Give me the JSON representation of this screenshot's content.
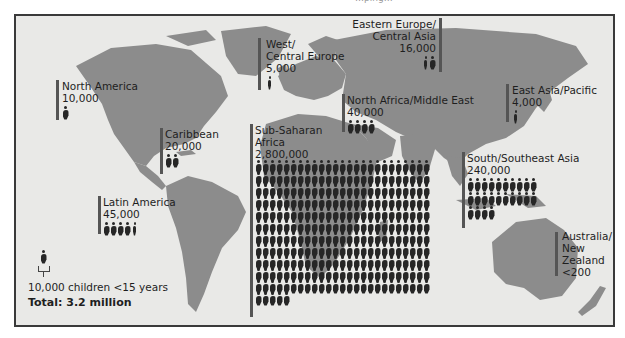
{
  "title_clip": "…ping…",
  "legend": {
    "unit_label": "10,000 children <15 years",
    "total_label": "Total: 3.2 million"
  },
  "regions": [
    {
      "id": "north-america",
      "name": "North America",
      "value": "10,000",
      "icons": 1
    },
    {
      "id": "west-central-europe",
      "name_line1": "West/",
      "name_line2": "Central Europe",
      "value": "5,000",
      "icons": 0.5
    },
    {
      "id": "eastern-europe-central-asia",
      "name_line1": "Eastern Europe/",
      "name_line2": "Central Asia",
      "value": "16,000",
      "icons": 1.6
    },
    {
      "id": "east-asia-pacific",
      "name": "East Asia/Pacific",
      "value": "4,000",
      "icons": 0.4
    },
    {
      "id": "north-africa-middle-east",
      "name": "North Africa/Middle East",
      "value": "40,000",
      "icons": 4
    },
    {
      "id": "caribbean",
      "name": "Caribbean",
      "value": "20,000",
      "icons": 2
    },
    {
      "id": "sub-saharan-africa",
      "name_line1": "Sub-Saharan",
      "name_line2": "Africa",
      "value": "2,800,000",
      "icons": 280
    },
    {
      "id": "south-southeast-asia",
      "name": "South/Southeast Asia",
      "value": "240,000",
      "icons": 24
    },
    {
      "id": "latin-america",
      "name": "Latin America",
      "value": "45,000",
      "icons": 4.5
    },
    {
      "id": "australia-new-zealand",
      "name_line1": "Australia/",
      "name_line2": "New",
      "name_line3": "Zealand",
      "value": "<200",
      "icons": 0
    }
  ],
  "colors": {
    "background": "#e9e9e7",
    "land": "#8c8c8c",
    "bar": "#555555",
    "icon": "#262626",
    "frame": "#3a3a3a"
  },
  "chart_data": {
    "type": "pictogram-map",
    "title": "",
    "unit": "1 icon = 10,000 children <15 years",
    "categories": [
      "North America",
      "West/Central Europe",
      "Eastern Europe/Central Asia",
      "East Asia/Pacific",
      "North Africa/Middle East",
      "Caribbean",
      "Sub-Saharan Africa",
      "South/Southeast Asia",
      "Latin America",
      "Australia/New Zealand"
    ],
    "values": [
      10000,
      5000,
      16000,
      4000,
      40000,
      20000,
      2800000,
      240000,
      45000,
      200
    ],
    "value_labels": [
      "10,000",
      "5,000",
      "16,000",
      "4,000",
      "40,000",
      "20,000",
      "2,800,000",
      "240,000",
      "45,000",
      "<200"
    ],
    "total": "3.2 million"
  }
}
